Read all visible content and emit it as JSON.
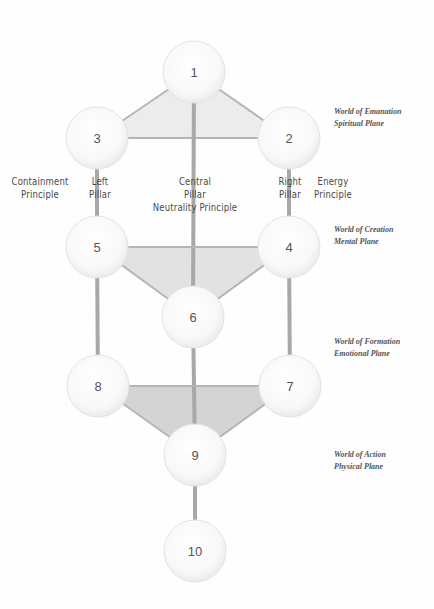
{
  "diagram": {
    "type": "tree-of-life",
    "nodes": [
      {
        "id": "1",
        "label": "1",
        "cx": 194,
        "cy": 72
      },
      {
        "id": "2",
        "label": "2",
        "cx": 289,
        "cy": 138
      },
      {
        "id": "3",
        "label": "3",
        "cx": 97,
        "cy": 138
      },
      {
        "id": "4",
        "label": "4",
        "cx": 289,
        "cy": 247
      },
      {
        "id": "5",
        "label": "5",
        "cx": 97,
        "cy": 247
      },
      {
        "id": "6",
        "label": "6",
        "cx": 193,
        "cy": 317
      },
      {
        "id": "7",
        "label": "7",
        "cx": 290,
        "cy": 386
      },
      {
        "id": "8",
        "label": "8",
        "cx": 98,
        "cy": 386
      },
      {
        "id": "9",
        "label": "9",
        "cx": 195,
        "cy": 455
      },
      {
        "id": "10",
        "label": "10",
        "cx": 195,
        "cy": 551
      }
    ],
    "node_radius": 31,
    "edges": [
      [
        "1",
        "2"
      ],
      [
        "1",
        "3"
      ],
      [
        "2",
        "3"
      ],
      [
        "3",
        "5"
      ],
      [
        "5",
        "8"
      ],
      [
        "2",
        "4"
      ],
      [
        "4",
        "7"
      ],
      [
        "1",
        "6"
      ],
      [
        "6",
        "9"
      ],
      [
        "9",
        "10"
      ],
      [
        "5",
        "4"
      ],
      [
        "5",
        "6"
      ],
      [
        "4",
        "6"
      ],
      [
        "8",
        "7"
      ],
      [
        "8",
        "9"
      ],
      [
        "7",
        "9"
      ]
    ],
    "triangles": [
      {
        "nodes": [
          "1",
          "3",
          "2"
        ],
        "fill": "#ececec"
      },
      {
        "nodes": [
          "5",
          "4",
          "6"
        ],
        "fill": "#e2e2e2"
      },
      {
        "nodes": [
          "8",
          "7",
          "9"
        ],
        "fill": "#d4d4d4"
      }
    ],
    "colors": {
      "line": "#b5b5b5",
      "pillar": "#a8a8a8",
      "node_fill": "#f7f7f7",
      "node_edge": "#e4e4e4"
    }
  },
  "pillars": {
    "left": {
      "line1": "Left",
      "line2": "Pillar"
    },
    "left_principle": {
      "line1": "Containment",
      "line2": "Principle"
    },
    "central": {
      "line1": "Central",
      "line2": "Pillar",
      "line3": "Neutrality Principle"
    },
    "right": {
      "line1": "Right",
      "line2": "Pillar"
    },
    "right_principle": {
      "line1": "Energy",
      "line2": "Principle"
    }
  },
  "worlds": [
    {
      "title": "World of Emanation",
      "plane": "Spiritual Plane"
    },
    {
      "title": "World of Creation",
      "plane": "Mental Plane"
    },
    {
      "title": "World of Formation",
      "plane": "Emotional Plane"
    },
    {
      "title": "World of Action",
      "plane": "Physical Plane"
    }
  ]
}
